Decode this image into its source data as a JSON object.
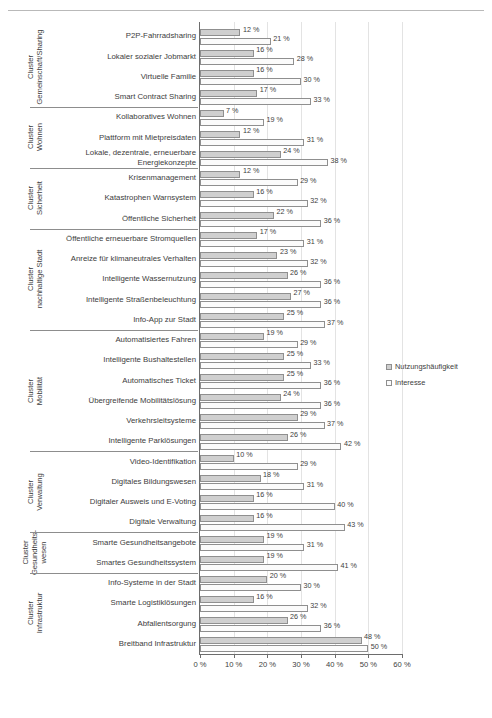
{
  "legend": {
    "position": "right",
    "entries": [
      {
        "key": "usage",
        "label": "Nutzungshäufigkeit",
        "color": "#cfcfcf"
      },
      {
        "key": "interest",
        "label": "Interesse",
        "color": "#fbfbfb"
      }
    ]
  },
  "axis": {
    "ticklabels": [
      "0 %",
      "10 %",
      "20 %",
      "30 %",
      "40 %",
      "50 %",
      "60 %"
    ],
    "ticks": [
      0,
      10,
      20,
      30,
      40,
      50,
      60
    ],
    "xmin": 0,
    "xmax": 60
  },
  "clusters": [
    {
      "label": "Cluster\nGemeinschaft/Sharing",
      "count": 4
    },
    {
      "label": "Cluster\nWohnen",
      "count": 3
    },
    {
      "label": "Cluster\nSicherheit",
      "count": 3
    },
    {
      "label": "Cluster\nnachhaltige Stadt",
      "count": 5
    },
    {
      "label": "Cluster\nMobilität",
      "count": 6
    },
    {
      "label": "Cluster\nVerwaltung",
      "count": 4
    },
    {
      "label": "Cluster\nGesundheits-\nwesen",
      "count": 2
    },
    {
      "label": "Cluster\nInfrastruktur",
      "count": 4
    }
  ],
  "chart_data": {
    "type": "bar",
    "orientation": "horizontal",
    "title": "",
    "xlabel": "",
    "ylabel": "",
    "xlim": [
      0,
      60
    ],
    "grid": true,
    "value_suffix": " %",
    "categories": [
      "P2P-Fahrradsharing",
      "Lokaler sozialer Jobmarkt",
      "Virtuelle Familie",
      "Smart Contract Sharing",
      "Kollaboratives Wohnen",
      "Plattform mit Mietpreisdaten",
      "Lokale, dezentrale, erneuerbare Energiekonzepte",
      "Krisenmanagement",
      "Katastrophen Warnsystem",
      "Öffentliche Sicherheit",
      "Öffentliche erneuerbare Stromquellen",
      "Anreize für klimaneutrales Verhalten",
      "Intelligente Wassernutzung",
      "Intelligente Straßenbeleuchtung",
      "Info-App zur Stadt",
      "Automatisiertes Fahren",
      "Intelligente Bushaltestellen",
      "Automatisches Ticket",
      "Übergreifende Mobilitätslösung",
      "Verkehrsleitsysteme",
      "Intelligente Parklösungen",
      "Video-Identifikation",
      "Digitales Bildungswesen",
      "Digitaler Ausweis und E-Voting",
      "Digitale Verwaltung",
      "Smarte Gesundheitsangebote",
      "Smartes Gesundheitssystem",
      "Info-Systeme in der Stadt",
      "Smarte Logistiklösungen",
      "Abfallentsorgung",
      "Breitband Infrastruktur"
    ],
    "series": [
      {
        "name": "Nutzungshäufigkeit",
        "color": "#cfcfcf",
        "values": [
          12,
          16,
          16,
          17,
          7,
          12,
          24,
          12,
          16,
          22,
          17,
          23,
          26,
          27,
          25,
          19,
          25,
          25,
          24,
          29,
          26,
          10,
          18,
          16,
          16,
          19,
          19,
          20,
          16,
          26,
          48
        ],
        "labels": [
          "12 %",
          "16 %",
          "16 %",
          "17 %",
          "7 %",
          "12 %",
          "24 %",
          "12 %",
          "16 %",
          "22 %",
          "17 %",
          "23 %",
          "26 %",
          "27 %",
          "25 %",
          "19 %",
          "25 %",
          "25 %",
          "24 %",
          "29 %",
          "26 %",
          "10 %",
          "18 %",
          "16 %",
          "16 %",
          "19 %",
          "19 %",
          "20 %",
          "16 %",
          "26 %",
          "48 %"
        ]
      },
      {
        "name": "Interesse",
        "color": "#fbfbfb",
        "values": [
          21,
          28,
          30,
          33,
          19,
          31,
          38,
          29,
          32,
          36,
          31,
          32,
          36,
          36,
          37,
          29,
          33,
          36,
          36,
          37,
          42,
          29,
          31,
          40,
          43,
          31,
          41,
          30,
          32,
          36,
          50
        ],
        "labels": [
          "21 %",
          "28 %",
          "30 %",
          "33 %",
          "19 %",
          "31 %",
          "38 %",
          "29 %",
          "32 %",
          "36 %",
          "31 %",
          "32 %",
          "36 %",
          "36 %",
          "37 %",
          "29 %",
          "33 %",
          "36 %",
          "36 %",
          "37 %",
          "42 %",
          "29 %",
          "31 %",
          "40 %",
          "43 %",
          "31 %",
          "41 %",
          "30 %",
          "32 %",
          "36 %",
          "50 %"
        ]
      }
    ]
  }
}
